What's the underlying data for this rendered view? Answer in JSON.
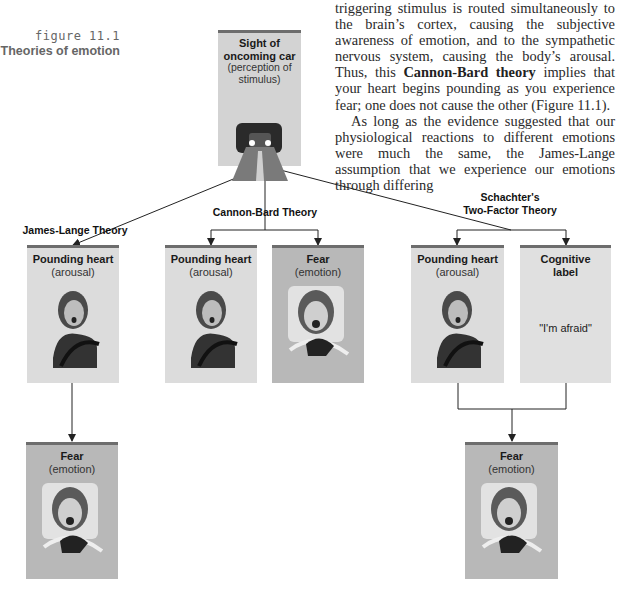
{
  "figure": {
    "number": "figure 11.1",
    "title": "Theories of emotion"
  },
  "body_text": {
    "paragraph_1": {
      "before_bold": "triggering stimulus is routed simultaneously to the brain’s cortex, causing the subjective awareness of emotion, and to the sympathetic nervous system, causing the body’s arousal. Thus, this ",
      "bold": "Cannon-Bard theory",
      "after_bold": " implies that your heart begins pounding as you experience fear; one does not cause the other (Figure 11.1)."
    },
    "paragraph_2": "As long as the evidence suggested that our physiological reactions to different emotions were much the same, the James-Lange assumption that we experience our emotions through differing"
  },
  "diagram": {
    "stimulus": {
      "heading": "Sight of oncoming car",
      "sub": "(perception of stimulus)",
      "image": "car-headlights-on-road"
    },
    "theories": [
      {
        "name": "James-Lange Theory",
        "boxes": [
          {
            "heading": "Pounding heart",
            "sub": "(arousal)",
            "image": "startled-driver"
          },
          {
            "heading": "Fear",
            "sub": "(emotion)",
            "image": "screaming-driver"
          }
        ]
      },
      {
        "name": "Cannon-Bard Theory",
        "boxes": [
          {
            "heading": "Pounding heart",
            "sub": "(arousal)",
            "image": "startled-driver"
          },
          {
            "heading": "Fear",
            "sub": "(emotion)",
            "image": "screaming-driver"
          }
        ]
      },
      {
        "name_line1": "Schachter's",
        "name_line2": "Two-Factor Theory",
        "boxes": [
          {
            "heading": "Pounding heart",
            "sub": "(arousal)",
            "image": "startled-driver"
          },
          {
            "heading_line1": "Cognitive",
            "heading_line2": "label",
            "quote": "\"I'm afraid\""
          },
          {
            "heading": "Fear",
            "sub": "(emotion)",
            "image": "screaming-driver"
          }
        ]
      }
    ]
  },
  "colors": {
    "box_fill": "#d3d3d3",
    "box_fill_dark": "#b8b8b8",
    "box_top_border": "#6d6d6d",
    "line": "#222222"
  }
}
